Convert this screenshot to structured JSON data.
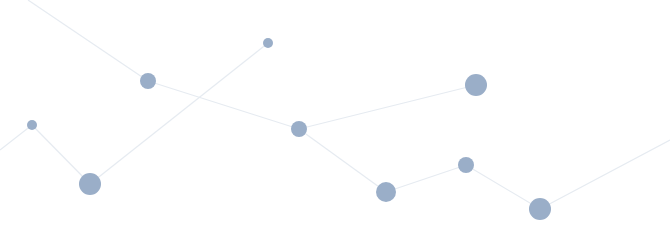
{
  "graphic": {
    "type": "network-constellation",
    "background": "#ffffff",
    "node_color": "#9aaec8",
    "edge_color": "#e6ebf1",
    "nodes": [
      {
        "id": "n1",
        "x": 32,
        "y": 125,
        "r": 5
      },
      {
        "id": "n2",
        "x": 90,
        "y": 184,
        "r": 11
      },
      {
        "id": "n3",
        "x": 148,
        "y": 81,
        "r": 8
      },
      {
        "id": "n4",
        "x": 268,
        "y": 43,
        "r": 5
      },
      {
        "id": "n5",
        "x": 299,
        "y": 129,
        "r": 8
      },
      {
        "id": "n6",
        "x": 386,
        "y": 192,
        "r": 10
      },
      {
        "id": "n7",
        "x": 466,
        "y": 165,
        "r": 8
      },
      {
        "id": "n8",
        "x": 476,
        "y": 85,
        "r": 11
      },
      {
        "id": "n9",
        "x": 540,
        "y": 209,
        "r": 11
      }
    ],
    "edges": [
      {
        "x1": 28,
        "y1": 0,
        "x2": 148,
        "y2": 81
      },
      {
        "x1": 148,
        "y1": 81,
        "x2": 299,
        "y2": 129
      },
      {
        "x1": 299,
        "y1": 129,
        "x2": 476,
        "y2": 85
      },
      {
        "x1": 299,
        "y1": 129,
        "x2": 386,
        "y2": 192
      },
      {
        "x1": 386,
        "y1": 192,
        "x2": 466,
        "y2": 165
      },
      {
        "x1": 466,
        "y1": 165,
        "x2": 540,
        "y2": 209
      },
      {
        "x1": 540,
        "y1": 209,
        "x2": 670,
        "y2": 140
      },
      {
        "x1": 90,
        "y1": 184,
        "x2": 268,
        "y2": 43
      },
      {
        "x1": 32,
        "y1": 125,
        "x2": 90,
        "y2": 184
      },
      {
        "x1": 0,
        "y1": 150,
        "x2": 32,
        "y2": 125
      }
    ]
  }
}
